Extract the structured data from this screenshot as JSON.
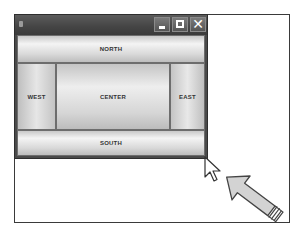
{
  "window": {
    "title": "",
    "controls": {
      "minimize_icon": "minimize-icon",
      "maximize_icon": "maximize-icon",
      "close_icon": "close-icon",
      "close_glyph": "✕"
    }
  },
  "layout": {
    "north": "NORTH",
    "west": "WEST",
    "center": "CENTER",
    "east": "EAST",
    "south": "SOUTH"
  },
  "annotations": {
    "cursor_icon": "mouse-pointer-icon",
    "resize_hint_arrow": "arrow-pointing-to-resize-corner"
  },
  "colors": {
    "titlebar": "#4a4a4a",
    "region_light": "#f4f4f4",
    "region_dark": "#bdbdbd",
    "outline": "#3a3a3a",
    "arrow_fill": "#d0d0d0"
  }
}
